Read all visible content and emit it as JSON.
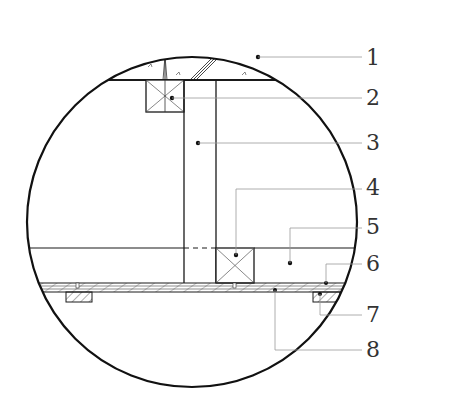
{
  "diagram": {
    "type": "detail-section",
    "view": "circular-callout",
    "colors": {
      "line": "#1a1a1a",
      "leader": "#9a9a9a",
      "label": "#333333",
      "background": "#ffffff"
    },
    "labels": [
      {
        "id": "1",
        "text": "1",
        "x": 366,
        "y": 47,
        "target": "concrete-slab"
      },
      {
        "id": "2",
        "text": "2",
        "x": 366,
        "y": 87,
        "target": "top-timber-block"
      },
      {
        "id": "3",
        "text": "3",
        "x": 366,
        "y": 132,
        "target": "vertical-hanger-stud"
      },
      {
        "id": "4",
        "text": "4",
        "x": 366,
        "y": 177,
        "target": "bottom-timber-block"
      },
      {
        "id": "5",
        "text": "5",
        "x": 366,
        "y": 215,
        "target": "ceiling-cavity"
      },
      {
        "id": "6",
        "text": "6",
        "x": 366,
        "y": 253,
        "target": "ceiling-board-layer"
      },
      {
        "id": "7",
        "text": "7",
        "x": 366,
        "y": 303,
        "target": "batten-block"
      },
      {
        "id": "8",
        "text": "8",
        "x": 366,
        "y": 339,
        "target": "board-surface"
      }
    ]
  }
}
